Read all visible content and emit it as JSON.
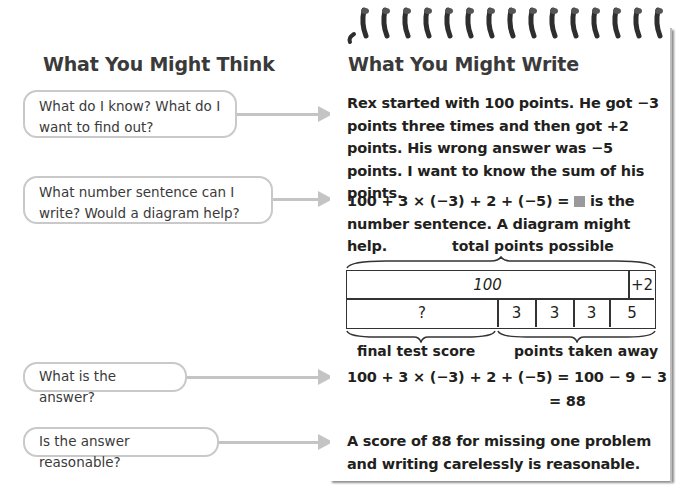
{
  "left_column": {
    "heading": "What You Might Think",
    "bubbles": [
      {
        "text": "What do I know? What do I want to find out?"
      },
      {
        "text": "What number sentence can I write? Would a diagram help?"
      },
      {
        "text": "What is the answer?"
      },
      {
        "text": "Is the answer reasonable?"
      }
    ]
  },
  "right_column": {
    "heading": "What You Might Write",
    "paragraph_1": "Rex started with 100 points. He got −3 points three times and then got +2 points. His wrong answer was −5 points. I want to know the sum of his points.",
    "paragraph_2_equation": "100 + 3 × (−3) + 2 + (−5) =",
    "paragraph_2_rest": "is the number sentence. A diagram might help.",
    "answer_line_1": "100 + 3 × (−3) + 2 + (−5) = 100 − 9 − 3",
    "answer_line_2": "= 88",
    "paragraph_4": "A score of 88 for missing one problem and writing carelessly is reasonable."
  },
  "diagram": {
    "top_label": "total points possible",
    "top_row": [
      {
        "value": "100"
      },
      {
        "value": "+2"
      }
    ],
    "bottom_row": [
      {
        "value": "?"
      },
      {
        "value": "3"
      },
      {
        "value": "3"
      },
      {
        "value": "3"
      },
      {
        "value": "5"
      }
    ],
    "bottom_label_left": "final test score",
    "bottom_label_right": "points taken away"
  },
  "colors": {
    "arrow": "#c4c4c4",
    "bubble_border": "#c9c9c9",
    "heading_text": "#3a3a3a",
    "blank_box": "#9a9a9a"
  }
}
